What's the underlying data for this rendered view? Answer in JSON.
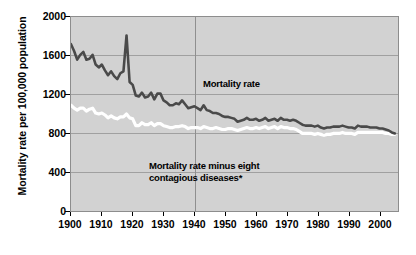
{
  "axes": {
    "ylabel": "Mortality rate per 100,000 population",
    "yticks": [
      "0",
      "400",
      "800",
      "1200",
      "1600",
      "2000"
    ],
    "xticks": [
      "1900",
      "1910",
      "1920",
      "1930",
      "1940",
      "1950",
      "1960",
      "1970",
      "1980",
      "1990",
      "2000"
    ]
  },
  "annotations": {
    "mortality_rate": "Mortality rate",
    "mortality_rate_minus": "Mortality rate minus eight contagious diseases*"
  },
  "colors": {
    "plot_background": "#d2d2d2",
    "gridline": "#a0a0a0",
    "frame": "#8d8d8d",
    "mortality_line": "#4a4a4a",
    "minus_line": "#ffffff",
    "text": "#000000"
  },
  "chart_data": {
    "type": "line",
    "title": "",
    "subtitle": "",
    "xlabel": "",
    "ylabel": "Mortality rate per 100,000 population",
    "xlim": [
      1900,
      2006
    ],
    "ylim": [
      0,
      2000
    ],
    "grid": true,
    "legend_position": "in-plot annotations",
    "x_tick_values": [
      1900,
      1910,
      1920,
      1930,
      1940,
      1950,
      1960,
      1970,
      1980,
      1990,
      2000
    ],
    "y_tick_values": [
      0,
      400,
      800,
      1200,
      1600,
      2000
    ],
    "vertical_reference_line": 1940,
    "footnote_marker": "*",
    "x": [
      1900,
      1901,
      1902,
      1903,
      1904,
      1905,
      1906,
      1907,
      1908,
      1909,
      1910,
      1911,
      1912,
      1913,
      1914,
      1915,
      1916,
      1917,
      1918,
      1919,
      1920,
      1921,
      1922,
      1923,
      1924,
      1925,
      1926,
      1927,
      1928,
      1929,
      1930,
      1931,
      1932,
      1933,
      1934,
      1935,
      1936,
      1937,
      1938,
      1939,
      1940,
      1941,
      1942,
      1943,
      1944,
      1945,
      1946,
      1947,
      1948,
      1949,
      1950,
      1951,
      1952,
      1953,
      1954,
      1955,
      1956,
      1957,
      1958,
      1959,
      1960,
      1961,
      1962,
      1963,
      1964,
      1965,
      1966,
      1967,
      1968,
      1969,
      1970,
      1971,
      1972,
      1973,
      1974,
      1975,
      1976,
      1977,
      1978,
      1979,
      1980,
      1981,
      1982,
      1983,
      1984,
      1985,
      1986,
      1987,
      1988,
      1989,
      1990,
      1991,
      1992,
      1993,
      1994,
      1995,
      1996,
      1997,
      1998,
      1999,
      2000,
      2001,
      2002,
      2003,
      2004,
      2005
    ],
    "series": [
      {
        "name": "Mortality rate",
        "color": "#4a4a4a",
        "values": [
          1720,
          1650,
          1560,
          1610,
          1640,
          1560,
          1570,
          1610,
          1510,
          1480,
          1510,
          1450,
          1400,
          1440,
          1390,
          1360,
          1420,
          1440,
          1810,
          1330,
          1300,
          1190,
          1180,
          1220,
          1170,
          1180,
          1220,
          1150,
          1210,
          1210,
          1140,
          1120,
          1090,
          1090,
          1110,
          1100,
          1140,
          1100,
          1060,
          1070,
          1080,
          1060,
          1040,
          1090,
          1040,
          1030,
          1010,
          1010,
          1000,
          980,
          970,
          970,
          960,
          950,
          920,
          930,
          940,
          960,
          940,
          940,
          950,
          930,
          940,
          960,
          930,
          940,
          950,
          930,
          960,
          940,
          940,
          930,
          940,
          930,
          910,
          890,
          880,
          880,
          880,
          870,
          880,
          860,
          850,
          860,
          860,
          870,
          870,
          870,
          880,
          870,
          860,
          860,
          850,
          880,
          870,
          870,
          870,
          860,
          860,
          860,
          850,
          850,
          840,
          830,
          810,
          800
        ]
      },
      {
        "name": "Mortality rate minus eight contagious diseases",
        "color": "#ffffff",
        "values": [
          1090,
          1060,
          1040,
          1060,
          1060,
          1030,
          1050,
          1060,
          1010,
          1000,
          1010,
          990,
          960,
          980,
          960,
          950,
          970,
          970,
          1000,
          960,
          950,
          880,
          880,
          910,
          890,
          890,
          910,
          880,
          900,
          900,
          880,
          870,
          860,
          860,
          870,
          870,
          880,
          870,
          850,
          860,
          860,
          860,
          850,
          870,
          860,
          850,
          850,
          860,
          850,
          840,
          840,
          850,
          850,
          840,
          830,
          840,
          850,
          860,
          850,
          850,
          860,
          850,
          860,
          870,
          850,
          860,
          870,
          850,
          870,
          860,
          860,
          850,
          850,
          840,
          820,
          800,
          800,
          800,
          800,
          790,
          800,
          790,
          780,
          790,
          790,
          800,
          800,
          800,
          810,
          800,
          800,
          800,
          790,
          810,
          810,
          810,
          810,
          810,
          810,
          810,
          810,
          810,
          800,
          800,
          790,
          790
        ]
      }
    ]
  }
}
